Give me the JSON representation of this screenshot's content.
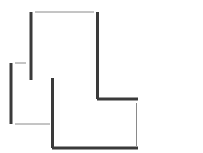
{
  "diagram": {
    "type": "line-drawing",
    "background": "#ffffff",
    "colors": {
      "thick_stroke": "#3a3a3a",
      "thin_stroke": "#8a8a8a"
    },
    "stroke_widths": {
      "thick": 3,
      "thin": 1
    },
    "segments": [
      {
        "id": "upper-left-vertical",
        "weight": "thick",
        "x1": 31,
        "y1": 12,
        "x2": 31,
        "y2": 80
      },
      {
        "id": "upper-top-horizontal",
        "weight": "thin",
        "x1": 35,
        "y1": 12,
        "x2": 94,
        "y2": 12
      },
      {
        "id": "upper-right-vertical",
        "weight": "thick",
        "x1": 97.5,
        "y1": 12,
        "x2": 97.5,
        "y2": 99
      },
      {
        "id": "upper-bottom-horizontal",
        "weight": "thick",
        "x1": 97,
        "y1": 99,
        "x2": 138,
        "y2": 99
      },
      {
        "id": "right-thin-vertical",
        "weight": "thin",
        "x1": 136.5,
        "y1": 103,
        "x2": 136.5,
        "y2": 146
      },
      {
        "id": "lower-left-vertical",
        "weight": "thick",
        "x1": 11,
        "y1": 63,
        "x2": 11,
        "y2": 124
      },
      {
        "id": "lower-top-horizontal",
        "weight": "thin",
        "x1": 15,
        "y1": 63,
        "x2": 26,
        "y2": 63
      },
      {
        "id": "lower-bottom-horizontal",
        "weight": "thin",
        "x1": 15,
        "y1": 124,
        "x2": 50,
        "y2": 124
      },
      {
        "id": "center-vertical",
        "weight": "thick",
        "x1": 52.5,
        "y1": 78,
        "x2": 52.5,
        "y2": 148
      },
      {
        "id": "bottom-horizontal",
        "weight": "thick",
        "x1": 52,
        "y1": 148,
        "x2": 138,
        "y2": 148
      }
    ]
  }
}
